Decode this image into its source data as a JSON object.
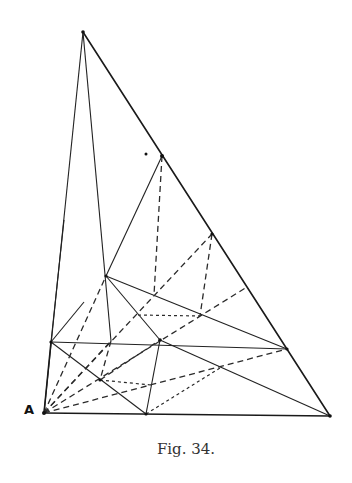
{
  "figure": {
    "caption": "Fig. 34.",
    "vertex_label": "A",
    "ink_color": "#1a1a1a",
    "background": "#ffffff"
  }
}
